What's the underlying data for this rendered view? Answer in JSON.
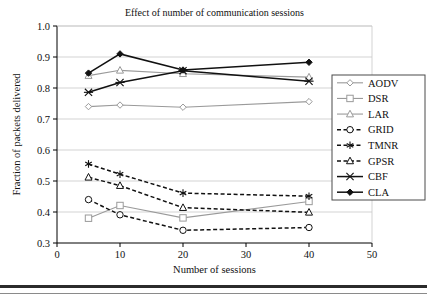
{
  "chart_data": {
    "type": "line",
    "title": "Effect of number of communication sessions",
    "xlabel": "Number of sessions",
    "ylabel": "Fraction of packets delivered",
    "x": [
      5,
      10,
      20,
      40
    ],
    "xlim": [
      0,
      50
    ],
    "ylim": [
      0.3,
      1.0
    ],
    "xticks": [
      "0",
      "10",
      "20",
      "30",
      "40",
      "50"
    ],
    "xtick_values": [
      0,
      10,
      20,
      30,
      40,
      50
    ],
    "yticks": [
      "0.3",
      "0.4",
      "0.5",
      "0.6",
      "0.7",
      "0.8",
      "0.9",
      "1.0"
    ],
    "ytick_values": [
      0.3,
      0.4,
      0.5,
      0.6,
      0.7,
      0.8,
      0.9,
      1.0
    ],
    "grid": "horizontal",
    "legend_position": "right",
    "series": [
      {
        "name": "AODV",
        "values": [
          0.74,
          0.745,
          0.738,
          0.756
        ],
        "color": "#9a9a9a",
        "dash": "solid",
        "marker": "diamond-open"
      },
      {
        "name": "DSR",
        "values": [
          0.38,
          0.421,
          0.381,
          0.434
        ],
        "color": "#9a9a9a",
        "dash": "solid",
        "marker": "square-open"
      },
      {
        "name": "LAR",
        "values": [
          0.84,
          0.857,
          0.846,
          0.835
        ],
        "color": "#9a9a9a",
        "dash": "solid",
        "marker": "triangle-open"
      },
      {
        "name": "GRID",
        "values": [
          0.44,
          0.391,
          0.341,
          0.35
        ],
        "color": "#111111",
        "dash": "dashed",
        "marker": "circle-open"
      },
      {
        "name": "TMNR",
        "values": [
          0.555,
          0.522,
          0.461,
          0.451
        ],
        "color": "#111111",
        "dash": "dashed",
        "marker": "asterisk"
      },
      {
        "name": "GPSR",
        "values": [
          0.512,
          0.485,
          0.414,
          0.399
        ],
        "color": "#111111",
        "dash": "dashed",
        "marker": "triangle-open"
      },
      {
        "name": "CBF",
        "values": [
          0.786,
          0.818,
          0.856,
          0.822
        ],
        "color": "#111111",
        "dash": "solid",
        "marker": "x-cross"
      },
      {
        "name": "CLA",
        "values": [
          0.848,
          0.91,
          0.858,
          0.883
        ],
        "color": "#111111",
        "dash": "solid",
        "marker": "diamond-filled"
      }
    ]
  },
  "legend": {
    "items": [
      {
        "label": "AODV"
      },
      {
        "label": "DSR"
      },
      {
        "label": "LAR"
      },
      {
        "label": "GRID"
      },
      {
        "label": "TMNR"
      },
      {
        "label": "GPSR"
      },
      {
        "label": "CBF"
      },
      {
        "label": "CLA"
      }
    ]
  }
}
